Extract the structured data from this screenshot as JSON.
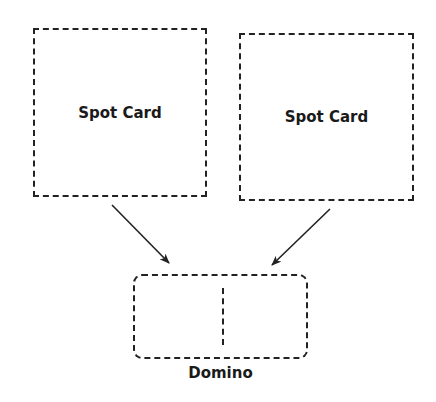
{
  "diagram": {
    "nodes": [
      {
        "id": "spot-card-left",
        "label": "Spot Card"
      },
      {
        "id": "spot-card-right",
        "label": "Spot Card"
      },
      {
        "id": "domino",
        "label": "Domino"
      }
    ],
    "edges": [
      {
        "from": "spot-card-left",
        "to": "domino"
      },
      {
        "from": "spot-card-right",
        "to": "domino"
      }
    ],
    "colors": {
      "stroke": "#222222",
      "background": "#ffffff",
      "text": "#1a1a1a"
    }
  }
}
